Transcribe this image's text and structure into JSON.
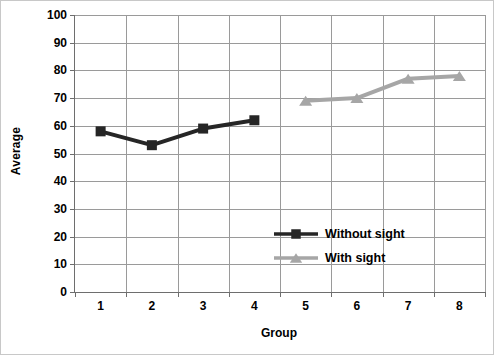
{
  "chart_data": {
    "type": "line",
    "title": "",
    "xlabel": "Group",
    "ylabel": "Average",
    "categories": [
      "1",
      "2",
      "3",
      "4",
      "5",
      "6",
      "7",
      "8"
    ],
    "x": [
      1,
      2,
      3,
      4,
      5,
      6,
      7,
      8
    ],
    "xlim": [
      0.5,
      8.5
    ],
    "ylim": [
      0,
      100
    ],
    "ytick_labels": [
      "0",
      "10",
      "20",
      "30",
      "40",
      "50",
      "60",
      "70",
      "80",
      "90",
      "100"
    ],
    "yticks": [
      0,
      10,
      20,
      30,
      40,
      50,
      60,
      70,
      80,
      90,
      100
    ],
    "grid": "horizontal-and-vertical",
    "legend_position": "inside-center-right",
    "series": [
      {
        "name": "Without sight",
        "color": "#262626",
        "marker": "square",
        "x": [
          1,
          2,
          3,
          4
        ],
        "values": [
          58,
          53,
          59,
          62
        ]
      },
      {
        "name": "With sight",
        "color": "#a6a6a6",
        "marker": "triangle",
        "x": [
          5,
          6,
          7,
          8
        ],
        "values": [
          69,
          70,
          77,
          78
        ]
      }
    ]
  },
  "legend": {
    "items": [
      {
        "label": "Without sight",
        "color": "#262626",
        "marker": "square"
      },
      {
        "label": "With sight",
        "color": "#a6a6a6",
        "marker": "triangle"
      }
    ]
  },
  "colors": {
    "without_sight": "#262626",
    "with_sight": "#a6a6a6",
    "gridline": "#9a9a9a",
    "axis": "#6e6e6e",
    "text": "#000000",
    "background": "#ffffff"
  }
}
